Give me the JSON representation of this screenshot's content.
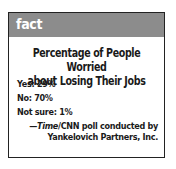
{
  "header": {
    "label": "fact",
    "color": "#8c8c8c"
  },
  "title": {
    "line1": "Percentage of People Worried",
    "line2": "about Losing Their Jobs"
  },
  "stats": [
    {
      "label": "Yes: 29%"
    },
    {
      "label": "No: 70%"
    },
    {
      "label": "Not sure: 1%"
    }
  ],
  "source": {
    "dash": "—",
    "publication": "Time",
    "line1_rest": "/CNN poll conducted by",
    "line2": "Yankelovich Partners, Inc."
  }
}
